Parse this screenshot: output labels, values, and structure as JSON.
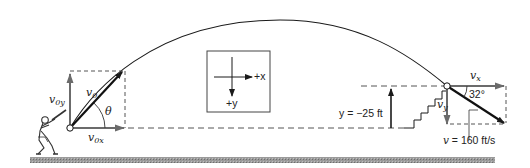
{
  "diagram": {
    "launch": {
      "v0_label": "v",
      "v0_sub": "0",
      "v0x_label": "v",
      "v0x_sub": "0x",
      "v0y_label": "v",
      "v0y_sub": "0y",
      "theta_label": "θ"
    },
    "axes_box": {
      "x_label": "+x",
      "y_label": "+y"
    },
    "landing": {
      "vx_label": "v",
      "vx_sub": "x",
      "vy_label": "v",
      "vy_sub": "y",
      "angle_label": "32°",
      "speed_label_var": "v",
      "speed_label_value": " = 160 ft/s",
      "height_label": "y = −25 ft"
    },
    "colors": {
      "line": "#1a1a1a",
      "dashed": "#555555",
      "arrow_gray": "#6b6b6b",
      "ground": "#8a8a8a"
    }
  }
}
